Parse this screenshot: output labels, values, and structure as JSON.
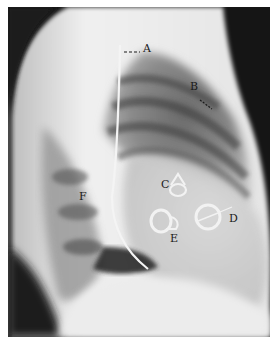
{
  "image": {
    "subject": "Lateral chest radiograph with prosthetic heart valves",
    "labels": [
      {
        "letter": "A",
        "x": 143,
        "y": 50
      },
      {
        "letter": "B",
        "x": 190,
        "y": 80
      },
      {
        "letter": "C",
        "x": 160,
        "y": 177
      },
      {
        "letter": "D",
        "x": 229,
        "y": 210
      },
      {
        "letter": "E",
        "x": 170,
        "y": 230
      },
      {
        "letter": "F",
        "x": 78,
        "y": 190
      }
    ]
  },
  "colors": {
    "background": "#ffffff",
    "film_dark": "#141414",
    "soft_tissue": "#e8e8e8",
    "label_text": "#1a1a1a"
  }
}
